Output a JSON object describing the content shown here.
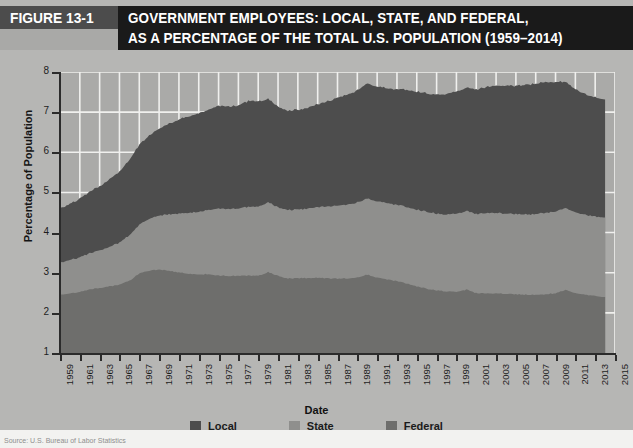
{
  "figure": {
    "tag": "FIGURE 13-1",
    "title_line1": "GOVERNMENT EMPLOYEES: LOCAL, STATE, AND FEDERAL,",
    "title_line2": "AS A PERCENTAGE OF THE TOTAL U.S. POPULATION (1959–2014)",
    "caption": "Source: U.S. Bureau of Labor Statistics"
  },
  "colors": {
    "tag_background": "#4c4c4c",
    "title_background": "#1a1a1a",
    "page_background": "#b6b6b4",
    "plot_background": "#aaaaa8",
    "gridline": "#f0f0ee",
    "axis": "#2b2b2b",
    "local": "#4d4d4d",
    "state": "#8f8f8d",
    "federal": "#6e6e6c"
  },
  "legend": {
    "position": "bottom-center",
    "items": [
      {
        "label": "Local",
        "color": "#4d4d4d"
      },
      {
        "label": "State",
        "color": "#8f8f8d"
      },
      {
        "label": "Federal",
        "color": "#6e6e6c"
      }
    ]
  },
  "chart_data": {
    "type": "area",
    "stacked": true,
    "title": "GOVERNMENT EMPLOYEES: LOCAL, STATE, AND FEDERAL, AS A PERCENTAGE OF THE TOTAL U.S. POPULATION (1959–2014)",
    "xlabel": "Date",
    "ylabel": "Percentage of Population",
    "ylim": [
      1,
      8
    ],
    "xlim": [
      1959,
      2015
    ],
    "ytick_labels": [
      "1",
      "2",
      "3",
      "4",
      "5",
      "6",
      "7",
      "8"
    ],
    "yticks": [
      1,
      2,
      3,
      4,
      5,
      6,
      7,
      8
    ],
    "xtick_labels": [
      "1959",
      "1961",
      "1963",
      "1965",
      "1967",
      "1969",
      "1971",
      "1973",
      "1975",
      "1977",
      "1979",
      "1981",
      "1983",
      "1985",
      "1987",
      "1989",
      "1991",
      "1993",
      "1995",
      "1997",
      "1999",
      "2001",
      "2003",
      "2005",
      "2007",
      "2009",
      "2011",
      "2013",
      "2015"
    ],
    "xticks": [
      1959,
      1961,
      1963,
      1965,
      1967,
      1969,
      1971,
      1973,
      1975,
      1977,
      1979,
      1981,
      1983,
      1985,
      1987,
      1989,
      1991,
      1993,
      1995,
      1997,
      1999,
      2001,
      2003,
      2005,
      2007,
      2009,
      2011,
      2013,
      2015
    ],
    "grid": true,
    "grid_color": "#f0f0ee",
    "x": [
      1959,
      1960,
      1961,
      1962,
      1963,
      1964,
      1965,
      1966,
      1967,
      1968,
      1969,
      1970,
      1971,
      1972,
      1973,
      1974,
      1975,
      1976,
      1977,
      1978,
      1979,
      1980,
      1981,
      1982,
      1983,
      1984,
      1985,
      1986,
      1987,
      1988,
      1989,
      1990,
      1991,
      1992,
      1993,
      1994,
      1995,
      1996,
      1997,
      1998,
      1999,
      2000,
      2001,
      2002,
      2003,
      2004,
      2005,
      2006,
      2007,
      2008,
      2009,
      2010,
      2011,
      2012,
      2013,
      2014
    ],
    "series": [
      {
        "name": "Federal",
        "color": "#6e6e6c",
        "note": "bottom band, cumulative top = federal value",
        "values": [
          2.45,
          2.48,
          2.52,
          2.58,
          2.62,
          2.66,
          2.7,
          2.8,
          2.98,
          3.05,
          3.08,
          3.05,
          3.0,
          2.98,
          2.95,
          2.97,
          2.93,
          2.92,
          2.92,
          2.93,
          2.92,
          3.02,
          2.92,
          2.86,
          2.86,
          2.87,
          2.88,
          2.86,
          2.85,
          2.86,
          2.88,
          2.95,
          2.88,
          2.83,
          2.79,
          2.73,
          2.66,
          2.6,
          2.56,
          2.53,
          2.52,
          2.58,
          2.49,
          2.48,
          2.48,
          2.48,
          2.46,
          2.45,
          2.45,
          2.46,
          2.49,
          2.57,
          2.5,
          2.45,
          2.42,
          2.4
        ]
      },
      {
        "name": "State",
        "color": "#8f8f8d",
        "note": "middle band thickness (state employment as % of population)",
        "values": [
          0.8,
          0.83,
          0.86,
          0.9,
          0.94,
          0.99,
          1.05,
          1.13,
          1.22,
          1.29,
          1.35,
          1.41,
          1.47,
          1.52,
          1.56,
          1.61,
          1.66,
          1.67,
          1.68,
          1.71,
          1.72,
          1.74,
          1.71,
          1.7,
          1.71,
          1.73,
          1.76,
          1.79,
          1.82,
          1.84,
          1.87,
          1.9,
          1.9,
          1.9,
          1.9,
          1.91,
          1.91,
          1.91,
          1.91,
          1.92,
          1.94,
          1.96,
          1.98,
          2.0,
          2.01,
          2.0,
          2.0,
          2.0,
          2.01,
          2.03,
          2.04,
          2.04,
          2.01,
          1.99,
          1.98,
          1.98
        ]
      },
      {
        "name": "Local",
        "color": "#4d4d4d",
        "note": "top band thickness (local employment as % of population)",
        "values": [
          1.35,
          1.4,
          1.46,
          1.53,
          1.6,
          1.68,
          1.77,
          1.88,
          1.99,
          2.08,
          2.17,
          2.26,
          2.34,
          2.4,
          2.45,
          2.5,
          2.56,
          2.55,
          2.57,
          2.64,
          2.62,
          2.57,
          2.5,
          2.47,
          2.48,
          2.51,
          2.56,
          2.62,
          2.68,
          2.74,
          2.8,
          2.86,
          2.86,
          2.86,
          2.88,
          2.92,
          2.94,
          2.95,
          2.97,
          3.0,
          3.04,
          3.07,
          3.1,
          3.14,
          3.17,
          3.18,
          3.2,
          3.23,
          3.25,
          3.26,
          3.22,
          3.15,
          3.06,
          3.0,
          2.96,
          2.94
        ]
      }
    ],
    "cumulative_top_total": [
      4.6,
      4.71,
      4.84,
      5.01,
      5.16,
      5.33,
      5.52,
      5.81,
      6.19,
      6.42,
      6.6,
      6.72,
      6.81,
      6.9,
      6.96,
      7.08,
      7.15,
      7.14,
      7.17,
      7.28,
      7.26,
      7.33,
      7.13,
      7.03,
      7.05,
      7.11,
      7.2,
      7.27,
      7.35,
      7.44,
      7.55,
      7.71,
      7.64,
      7.59,
      7.57,
      7.56,
      7.51,
      7.46,
      7.44,
      7.45,
      7.5,
      7.61,
      7.57,
      7.62,
      7.66,
      7.66,
      7.66,
      7.68,
      7.71,
      7.75,
      7.75,
      7.76,
      7.57,
      7.44,
      7.36,
      7.32
    ]
  }
}
